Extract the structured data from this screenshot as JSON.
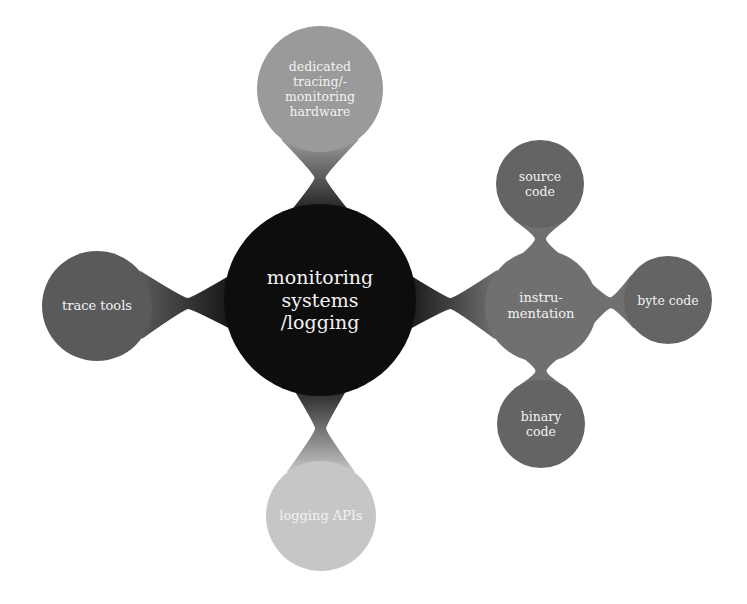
{
  "colors": {
    "background": "#ffffff",
    "root": "#0d0d0d",
    "level1_dark": "#5c5c5c",
    "level1_mid": "#707070",
    "level1_light": "#9c9c9c",
    "level1_lightest": "#c4c4c4",
    "level2": "#646464",
    "text": "#f2f2f2"
  },
  "nodes": {
    "root": {
      "label": "monitoring\nsystems\n/logging",
      "cx": 320,
      "cy": 300,
      "r": 96,
      "color": "#0d0d0d",
      "font_size": 19
    },
    "dedicated": {
      "label": "dedicated\ntracing/-\nmonitoring\nhardware",
      "cx": 320,
      "cy": 89,
      "r": 63,
      "color": "#9a9a9a",
      "font_size": 12.5
    },
    "trace_tools": {
      "label": "trace tools",
      "cx": 97,
      "cy": 306,
      "r": 55,
      "color": "#5a5a5a",
      "font_size": 13
    },
    "logging_apis": {
      "label": "logging APIs",
      "cx": 321,
      "cy": 516,
      "r": 55,
      "color": "#c6c6c6",
      "font_size": 13
    },
    "instrumentation": {
      "label": "instru-\nmentation",
      "cx": 541,
      "cy": 306,
      "r": 56,
      "color": "#707070",
      "font_size": 13
    },
    "source_code": {
      "label": "source\ncode",
      "cx": 540,
      "cy": 184,
      "r": 44,
      "color": "#646464",
      "font_size": 12.5
    },
    "byte_code": {
      "label": "byte code",
      "cx": 668,
      "cy": 300,
      "r": 44,
      "color": "#646464",
      "font_size": 12.5
    },
    "binary_code": {
      "label": "binary\ncode",
      "cx": 541,
      "cy": 424,
      "r": 44,
      "color": "#646464",
      "font_size": 12.5
    }
  },
  "edges": [
    {
      "from": "root",
      "to": "dedicated"
    },
    {
      "from": "root",
      "to": "trace_tools"
    },
    {
      "from": "root",
      "to": "logging_apis"
    },
    {
      "from": "root",
      "to": "instrumentation"
    },
    {
      "from": "instrumentation",
      "to": "source_code"
    },
    {
      "from": "instrumentation",
      "to": "byte_code"
    },
    {
      "from": "instrumentation",
      "to": "binary_code"
    }
  ]
}
